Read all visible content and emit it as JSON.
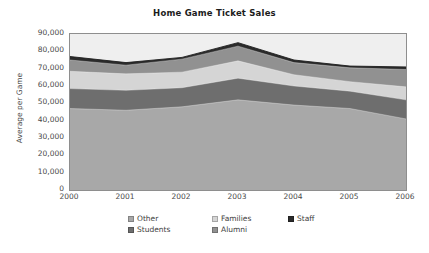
{
  "chart_data": {
    "type": "area",
    "title": "Home Game Ticket Sales",
    "xlabel": "",
    "ylabel": "Average per Game",
    "categories": [
      "2000",
      "2001",
      "2002",
      "2003",
      "2004",
      "2005",
      "2006"
    ],
    "x": [
      2000,
      2001,
      2002,
      2003,
      2004,
      2005,
      2006
    ],
    "ylim": [
      0,
      90000
    ],
    "yticks": [
      0,
      10000,
      20000,
      30000,
      40000,
      50000,
      60000,
      70000,
      80000,
      90000
    ],
    "ytick_labels": [
      "0",
      "10,000",
      "20,000",
      "30,000",
      "40,000",
      "50,000",
      "60,000",
      "70,000",
      "80,000",
      "90,000"
    ],
    "xtick_labels": [
      "2000",
      "2001",
      "2002",
      "2003",
      "2004",
      "2005",
      "2006"
    ],
    "stacked": true,
    "grid": false,
    "legend_position": "bottom",
    "plot_background": "#efefef",
    "series": [
      {
        "name": "Other",
        "color": "#a8a8a8",
        "values": [
          47000,
          46000,
          48000,
          52000,
          49000,
          47000,
          41000
        ],
        "cumulative": [
          47000,
          46000,
          48000,
          52000,
          49000,
          47000,
          41000
        ]
      },
      {
        "name": "Students",
        "color": "#6e6e6e",
        "values": [
          11500,
          11500,
          11000,
          12500,
          11000,
          10000,
          11000
        ],
        "cumulative": [
          58500,
          57500,
          59000,
          64500,
          60000,
          57000,
          52000
        ]
      },
      {
        "name": "Families",
        "color": "#d5d5d5",
        "values": [
          10000,
          9500,
          9000,
          10000,
          6500,
          5500,
          7500
        ],
        "cumulative": [
          68500,
          67000,
          68000,
          74500,
          66500,
          62500,
          59500
        ]
      },
      {
        "name": "Alumni",
        "color": "#919191",
        "values": [
          6500,
          5000,
          7500,
          8500,
          7000,
          8000,
          10000
        ],
        "cumulative": [
          75000,
          72000,
          75500,
          83000,
          73500,
          70500,
          69500
        ]
      },
      {
        "name": "Staff",
        "color": "#2b2b2b",
        "values": [
          2000,
          1500,
          1000,
          2000,
          1500,
          1000,
          1500
        ],
        "cumulative": [
          77000,
          73500,
          76500,
          85000,
          75000,
          71500,
          71000
        ]
      }
    ],
    "totals": [
      77000,
      73500,
      76500,
      85000,
      75000,
      71500,
      71000
    ]
  },
  "legend": {
    "items": [
      {
        "label": "Other",
        "color": "#a8a8a8"
      },
      {
        "label": "Families",
        "color": "#d5d5d5"
      },
      {
        "label": "Staff",
        "color": "#2b2b2b"
      },
      {
        "label": "Students",
        "color": "#6e6e6e"
      },
      {
        "label": "Alumni",
        "color": "#919191"
      }
    ]
  }
}
